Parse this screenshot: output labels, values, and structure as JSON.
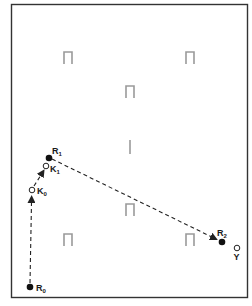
{
  "diagram": {
    "type": "navigation-path-diagram",
    "frame": {
      "x": 11,
      "y": 4,
      "width": 237,
      "height": 294,
      "stroke": "#333333"
    },
    "colors": {
      "path": "#222222",
      "landmark": "#9a9a9a",
      "point_fill": "#111111",
      "background": "#ffffff"
    },
    "landmarks": [
      {
        "id": "landmark-top-left",
        "shape": "arch",
        "x": 68,
        "y": 58
      },
      {
        "id": "landmark-top-right",
        "shape": "arch",
        "x": 190,
        "y": 58
      },
      {
        "id": "landmark-upper-center",
        "shape": "arch",
        "x": 130,
        "y": 92
      },
      {
        "id": "landmark-center-bar",
        "shape": "bar",
        "x": 130,
        "y": 146
      },
      {
        "id": "landmark-lower-center",
        "shape": "arch",
        "x": 130,
        "y": 210
      },
      {
        "id": "landmark-bottom-left",
        "shape": "arch",
        "x": 68,
        "y": 240
      },
      {
        "id": "landmark-bottom-right",
        "shape": "arch",
        "x": 190,
        "y": 240
      }
    ],
    "points": {
      "R0": {
        "label": "R",
        "sub": "0",
        "kind": "filled",
        "x": 30,
        "y": 287
      },
      "K0": {
        "label": "K",
        "sub": "0",
        "kind": "open",
        "x": 32,
        "y": 190
      },
      "K1": {
        "label": "K",
        "sub": "1",
        "kind": "open",
        "x": 46,
        "y": 166
      },
      "R1": {
        "label": "R",
        "sub": "1",
        "kind": "filled",
        "x": 49,
        "y": 158
      },
      "R2": {
        "label": "R",
        "sub": "2",
        "kind": "filled",
        "x": 222,
        "y": 242
      },
      "Y": {
        "label": "Y",
        "sub": "",
        "kind": "open",
        "x": 237,
        "y": 248
      }
    },
    "paths": [
      {
        "from": "R0",
        "to": "K0",
        "style": "dashed-arrow"
      },
      {
        "from": "K0",
        "to": "K1",
        "style": "dashed-arrow"
      },
      {
        "from": "R1",
        "to": "R2",
        "style": "dashed-arrow"
      }
    ],
    "labels": {
      "R0": "R",
      "R0_sub": "0",
      "K0": "K",
      "K0_sub": "0",
      "K1": "K",
      "K1_sub": "1",
      "R1": "R",
      "R1_sub": "1",
      "R2": "R",
      "R2_sub": "2",
      "Y": "Y"
    }
  }
}
